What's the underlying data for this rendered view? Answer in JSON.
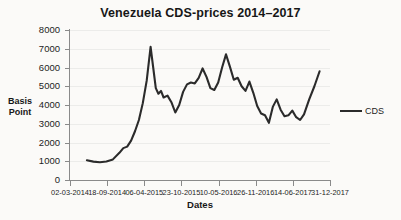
{
  "chart_data": {
    "type": "line",
    "title": "Venezuela CDS-prices 2014–2017",
    "xlabel": "Dates",
    "ylabel": "Basis Point",
    "ylim": [
      0,
      8000
    ],
    "ytick_labels": [
      "8000",
      "7000",
      "6000",
      "5000",
      "4000",
      "3000",
      "2000",
      "1000",
      "0"
    ],
    "ytick_values": [
      8000,
      7000,
      6000,
      5000,
      4000,
      3000,
      2000,
      1000,
      0
    ],
    "xtick_labels": [
      "02-03-2014",
      "18-09-2014",
      "06-04-2015",
      "23-10-2015",
      "10-05-2016",
      "26-11-2016",
      "14-06-2017",
      "31-12-2017"
    ],
    "xtick_positions": [
      0,
      14.29,
      28.57,
      42.86,
      57.14,
      71.43,
      85.71,
      100
    ],
    "grid": true,
    "legend_position": "right",
    "series": [
      {
        "name": "CDS",
        "color": "#2b2b2b",
        "x": [
          6.5,
          9.0,
          11.5,
          14.0,
          16.5,
          19.0,
          20.5,
          22.0,
          23.5,
          25.0,
          26.5,
          28.0,
          29.5,
          31.0,
          32.0,
          33.0,
          34.0,
          35.0,
          36.0,
          37.5,
          39.0,
          40.5,
          42.0,
          43.5,
          45.0,
          46.5,
          48.0,
          49.5,
          51.0,
          52.5,
          54.0,
          55.5,
          57.0,
          58.5,
          60.0,
          61.5,
          63.0,
          64.5,
          66.0,
          67.5,
          69.0,
          70.5,
          72.0,
          73.5,
          75.0,
          76.5,
          78.0,
          79.5,
          81.0,
          82.5,
          84.0,
          85.5,
          87.0,
          88.5,
          90.0,
          92.0,
          94.0,
          96.0
        ],
        "y": [
          1050,
          980,
          950,
          990,
          1100,
          1450,
          1700,
          1780,
          2100,
          2600,
          3200,
          4100,
          5300,
          7100,
          6000,
          4900,
          4600,
          4750,
          4400,
          4500,
          4150,
          3600,
          4000,
          4700,
          5100,
          5200,
          5150,
          5450,
          5950,
          5500,
          4900,
          4800,
          5200,
          6000,
          6700,
          6050,
          5350,
          5450,
          5000,
          4750,
          5250,
          4650,
          3950,
          3550,
          3450,
          3050,
          3900,
          4300,
          3750,
          3400,
          3450,
          3700,
          3350,
          3200,
          3500,
          4300,
          5000,
          5800
        ]
      }
    ]
  },
  "legend": {
    "label": "CDS"
  }
}
